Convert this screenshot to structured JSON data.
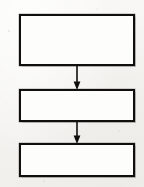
{
  "document": {
    "kind": "flowchart-diagram",
    "title": "",
    "orientation": "vertical",
    "background_color": "#f6f5f3",
    "ink_color": "#100f0e",
    "box_fill_color": "#fdfdfc"
  },
  "diagram": {
    "nodes": [
      {
        "id": "node-1",
        "name": "flow-box-top",
        "label": "",
        "shape": "rectangle",
        "x": 19,
        "y": 14,
        "width": 116,
        "height": 52,
        "border_width": 2
      },
      {
        "id": "node-2",
        "name": "flow-box-middle",
        "label": "",
        "shape": "rectangle",
        "x": 19,
        "y": 89,
        "width": 116,
        "height": 33,
        "border_width": 2
      },
      {
        "id": "node-3",
        "name": "flow-box-bottom",
        "label": "",
        "shape": "rectangle",
        "x": 19,
        "y": 143,
        "width": 116,
        "height": 34,
        "border_width": 2
      }
    ],
    "connectors": [
      {
        "id": "connector-1",
        "name": "arrow-top-to-middle",
        "from": "node-1",
        "to": "node-2",
        "label": "",
        "direction": "down",
        "arrowhead": "solid-triangle",
        "x": 73,
        "y": 65,
        "width": 8,
        "height": 25
      },
      {
        "id": "connector-2",
        "name": "arrow-middle-to-bottom",
        "from": "node-2",
        "to": "node-3",
        "label": "",
        "direction": "down",
        "arrowhead": "solid-triangle",
        "x": 73,
        "y": 121,
        "width": 8,
        "height": 23
      }
    ]
  }
}
